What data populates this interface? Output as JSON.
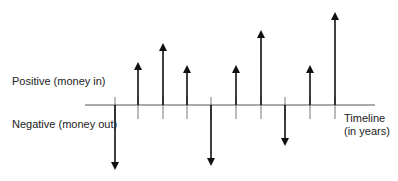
{
  "labels": {
    "positive": "Positive (money in)",
    "negative": "Negative (money out)",
    "timeline_line1": "Timeline",
    "timeline_line2": "(in years)"
  },
  "colors": {
    "axis": "#555555",
    "tick": "#777777",
    "arrow": "#111111"
  },
  "axis": {
    "y": 105,
    "x_start": 85,
    "x_end": 375,
    "tick_above": 8,
    "tick_below": 14
  },
  "cash_flows": [
    {
      "period": 1,
      "x": 115,
      "direction": "out",
      "tip_y": 170
    },
    {
      "period": 2,
      "x": 138,
      "direction": "in",
      "tip_y": 62
    },
    {
      "period": 3,
      "x": 163,
      "direction": "in",
      "tip_y": 43
    },
    {
      "period": 4,
      "x": 187,
      "direction": "in",
      "tip_y": 65
    },
    {
      "period": 5,
      "x": 211,
      "direction": "out",
      "tip_y": 166
    },
    {
      "period": 6,
      "x": 236,
      "direction": "in",
      "tip_y": 65
    },
    {
      "period": 7,
      "x": 261,
      "direction": "in",
      "tip_y": 30
    },
    {
      "period": 8,
      "x": 285,
      "direction": "out",
      "tip_y": 146
    },
    {
      "period": 9,
      "x": 310,
      "direction": "in",
      "tip_y": 65
    },
    {
      "period": 10,
      "x": 335,
      "direction": "in",
      "tip_y": 12
    }
  ]
}
